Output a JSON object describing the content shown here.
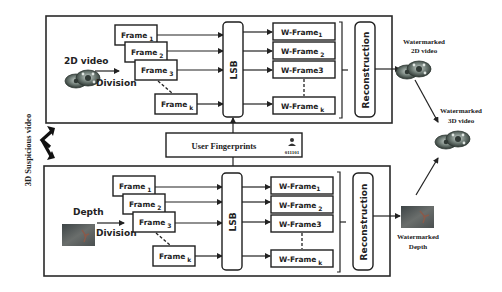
{
  "diagram": {
    "side_label": "3D Suspicious video",
    "fingerprint": {
      "label": "User Fingerprints",
      "bits": "011101"
    },
    "lsb_label": "LSB",
    "reconstruction_label": "Reconstruction",
    "top_panel": {
      "input_label": "2D video",
      "division_label": "Division",
      "frames": [
        {
          "base": "Frame",
          "sub": "1"
        },
        {
          "base": "Frame",
          "sub": "2"
        },
        {
          "base": "Frame",
          "sub": "3"
        },
        {
          "base": "Frame",
          "sub": "k"
        }
      ],
      "w_frames": [
        {
          "base": "W-Frame",
          "sub": "1"
        },
        {
          "base": "W-Frame",
          "sub": "2"
        },
        {
          "base": "W-Frame3",
          "sub": ""
        },
        {
          "base": "W-Frame",
          "sub": "k"
        }
      ]
    },
    "bottom_panel": {
      "input_label": "Depth",
      "division_label": "Division",
      "frames": [
        {
          "base": "Frame",
          "sub": "1"
        },
        {
          "base": "Frame",
          "sub": "2"
        },
        {
          "base": "Frame",
          "sub": "3"
        },
        {
          "base": "Frame",
          "sub": "k"
        }
      ],
      "w_frames": [
        {
          "base": "W-Frame",
          "sub": "1"
        },
        {
          "base": "W-Frame",
          "sub": "2"
        },
        {
          "base": "W-Frame3",
          "sub": ""
        },
        {
          "base": "W-Frame",
          "sub": "k"
        }
      ]
    },
    "outputs": {
      "watermarked_2d": {
        "line1": "Watermarked",
        "line2": "2D video"
      },
      "watermarked_3d": {
        "line1": "Watermarked",
        "line2": "3D video"
      },
      "watermarked_depth": {
        "line1": "Watermarked",
        "line2": "Depth"
      }
    },
    "icons": {
      "video_reel": "film-reel-icon",
      "depth_image": "depth-map-icon",
      "fingerprint_user": "user-key-icon",
      "bidirectional_arrow": "double-arrow-icon"
    },
    "colors": {
      "stroke": "#222222",
      "background": "#ffffff",
      "reel_dark": "#3f4a45",
      "reel_light": "#9aa6a0",
      "depth_dark": "#4a4f50",
      "depth_accent": "#8a5a4a"
    }
  }
}
